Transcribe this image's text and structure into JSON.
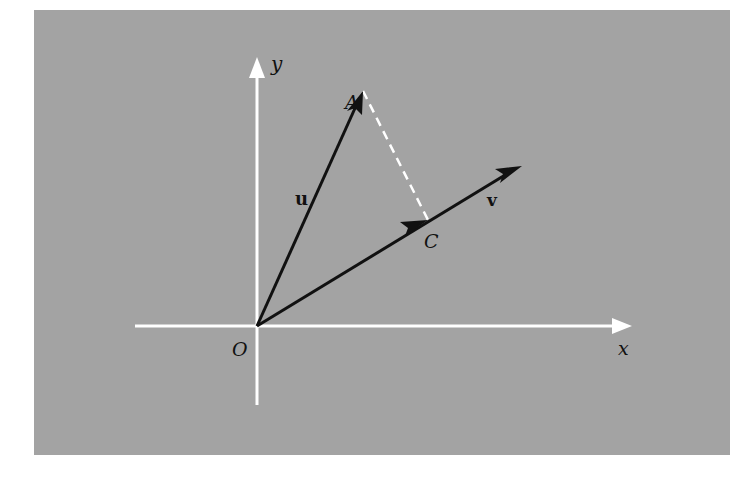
{
  "figure": {
    "background_color": "#a3a3a3",
    "axis_color": "#ffffff",
    "vector_color": "#111111",
    "projection_line_color": "#ffffff",
    "labels": {
      "y_axis": "y",
      "x_axis": "x",
      "origin": "O",
      "point_a": "A",
      "point_c": "C",
      "vector_u": "u",
      "vector_v": "v"
    },
    "points": {
      "O": [
        257,
        326
      ],
      "A": [
        363,
        91
      ],
      "C": [
        428,
        220
      ],
      "v_tip": [
        522,
        166
      ]
    },
    "elements": [
      {
        "type": "axis",
        "name": "x-axis",
        "from": [
          135,
          326
        ],
        "to": [
          632,
          326
        ]
      },
      {
        "type": "axis",
        "name": "y-axis",
        "from": [
          257,
          405
        ],
        "to": [
          257,
          57
        ]
      },
      {
        "type": "vector",
        "name": "u",
        "from": "O",
        "to": "A"
      },
      {
        "type": "vector",
        "name": "v",
        "from": "O",
        "to": "v_tip",
        "mid_arrow_at": "C"
      },
      {
        "type": "dashed-segment",
        "name": "projection",
        "from": "A",
        "to": "C"
      }
    ]
  }
}
